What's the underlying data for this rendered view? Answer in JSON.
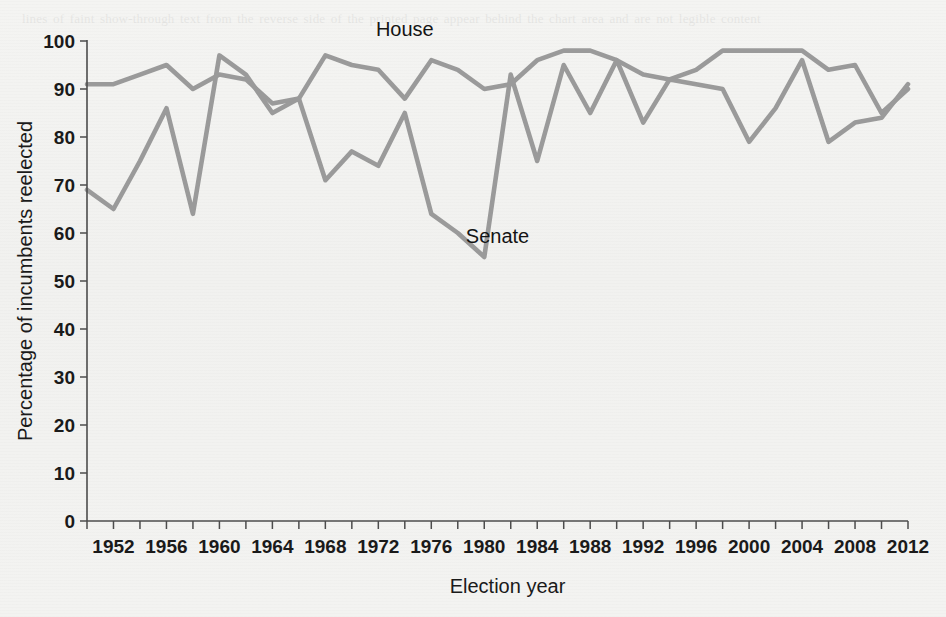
{
  "figure": {
    "background_color": "#f2f2f0",
    "line_color": "#9a9a9a",
    "axis_color": "#4c4c4c",
    "text_color": "#1a1a1a"
  },
  "labels": {
    "house": "House",
    "senate": "Senate",
    "xlabel": "Election year",
    "ylabel": "Percentage of incumbents reelected"
  },
  "ghost_text": "lines of faint show-through text from the reverse side of the printed page appear behind the chart area and are not legible content",
  "chart_data": {
    "type": "line",
    "title": "",
    "xlabel": "Election year",
    "ylabel": "Percentage of incumbents reelected",
    "xlim": [
      1950,
      2012
    ],
    "ylim": [
      0,
      100
    ],
    "grid": false,
    "legend": "inline-annotations",
    "y_ticks": [
      0,
      10,
      20,
      30,
      40,
      50,
      60,
      70,
      80,
      90,
      100
    ],
    "x_ticks": [
      1950,
      1952,
      1954,
      1956,
      1958,
      1960,
      1962,
      1964,
      1966,
      1968,
      1970,
      1972,
      1974,
      1976,
      1978,
      1980,
      1982,
      1984,
      1986,
      1988,
      1990,
      1992,
      1994,
      1996,
      1998,
      2000,
      2002,
      2004,
      2006,
      2008,
      2010,
      2012
    ],
    "x_tick_labels": [
      {
        "x": 1952,
        "label": "1952"
      },
      {
        "x": 1956,
        "label": "1956"
      },
      {
        "x": 1960,
        "label": "1960"
      },
      {
        "x": 1964,
        "label": "1964"
      },
      {
        "x": 1968,
        "label": "1968"
      },
      {
        "x": 1972,
        "label": "1972"
      },
      {
        "x": 1976,
        "label": "1976"
      },
      {
        "x": 1980,
        "label": "1980"
      },
      {
        "x": 1984,
        "label": "1984"
      },
      {
        "x": 1988,
        "label": "1988"
      },
      {
        "x": 1992,
        "label": "1992"
      },
      {
        "x": 1996,
        "label": "1996"
      },
      {
        "x": 2000,
        "label": "2000"
      },
      {
        "x": 2004,
        "label": "2004"
      },
      {
        "x": 2008,
        "label": "2008"
      },
      {
        "x": 2012,
        "label": "2012"
      }
    ],
    "x": [
      1950,
      1952,
      1954,
      1956,
      1958,
      1960,
      1962,
      1964,
      1966,
      1968,
      1970,
      1972,
      1974,
      1976,
      1978,
      1980,
      1982,
      1984,
      1986,
      1988,
      1990,
      1992,
      1994,
      1996,
      1998,
      2000,
      2002,
      2004,
      2006,
      2008,
      2010,
      2012
    ],
    "series": [
      {
        "name": "House",
        "color": "#9a9a9a",
        "label_x": 1974,
        "label_y": 101,
        "values": [
          91,
          91,
          93,
          95,
          90,
          93,
          92,
          87,
          88,
          97,
          95,
          94,
          88,
          96,
          94,
          90,
          91,
          96,
          98,
          98,
          96,
          93,
          92,
          94,
          98,
          98,
          98,
          98,
          94,
          95,
          85,
          90
        ]
      },
      {
        "name": "Senate",
        "color": "#9a9a9a",
        "label_x": 1981,
        "label_y": 58,
        "values": [
          69,
          65,
          75,
          86,
          64,
          97,
          93,
          85,
          88,
          71,
          77,
          74,
          85,
          64,
          60,
          55,
          93,
          75,
          95,
          85,
          96,
          83,
          92,
          91,
          90,
          79,
          86,
          96,
          79,
          83,
          84,
          91
        ]
      }
    ]
  }
}
